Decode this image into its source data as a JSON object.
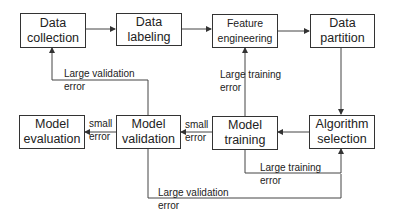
{
  "diagram": {
    "type": "flowchart",
    "nodes": {
      "data_collection": {
        "line1": "Data",
        "line2": "collection"
      },
      "data_labeling": {
        "line1": "Data",
        "line2": "labeling"
      },
      "feature_engineering": {
        "line1": "Feature",
        "line2": "engineering"
      },
      "data_partition": {
        "line1": "Data",
        "line2": "partition"
      },
      "algorithm_selection": {
        "line1": "Algorithm",
        "line2": "selection"
      },
      "model_training": {
        "line1": "Model",
        "line2": "training"
      },
      "model_validation": {
        "line1": "Model",
        "line2": "validation"
      },
      "model_evaluation": {
        "line1": "Model",
        "line2": "evaluation"
      }
    },
    "edge_labels": {
      "validation_to_collection": {
        "line1": "Large validation",
        "line2": "error"
      },
      "training_to_feature": {
        "line1": "Large training",
        "line2": "error"
      },
      "validation_to_evaluation": {
        "line1": "small",
        "line2": "error"
      },
      "training_to_validation": {
        "line1": "small",
        "line2": "error"
      },
      "training_to_algorithm": {
        "line1": "Large training",
        "line2": "error"
      },
      "validation_to_algorithm": {
        "line1": "Large validation",
        "line2": "error"
      }
    },
    "edges": [
      {
        "from": "Data collection",
        "to": "Data labeling"
      },
      {
        "from": "Data labeling",
        "to": "Feature engineering"
      },
      {
        "from": "Feature engineering",
        "to": "Data partition"
      },
      {
        "from": "Data partition",
        "to": "Algorithm selection"
      },
      {
        "from": "Algorithm selection",
        "to": "Model training"
      },
      {
        "from": "Model training",
        "to": "Model validation",
        "label": "small error"
      },
      {
        "from": "Model validation",
        "to": "Model evaluation",
        "label": "small error"
      },
      {
        "from": "Model validation",
        "to": "Data collection",
        "label": "Large validation error"
      },
      {
        "from": "Model training",
        "to": "Feature engineering",
        "label": "Large training error"
      },
      {
        "from": "Model training",
        "to": "Algorithm selection",
        "label": "Large training error"
      },
      {
        "from": "Model validation",
        "to": "Algorithm selection",
        "label": "Large validation error"
      }
    ],
    "colors": {
      "stroke": "#333333",
      "text": "#222222",
      "background": "#ffffff"
    }
  }
}
